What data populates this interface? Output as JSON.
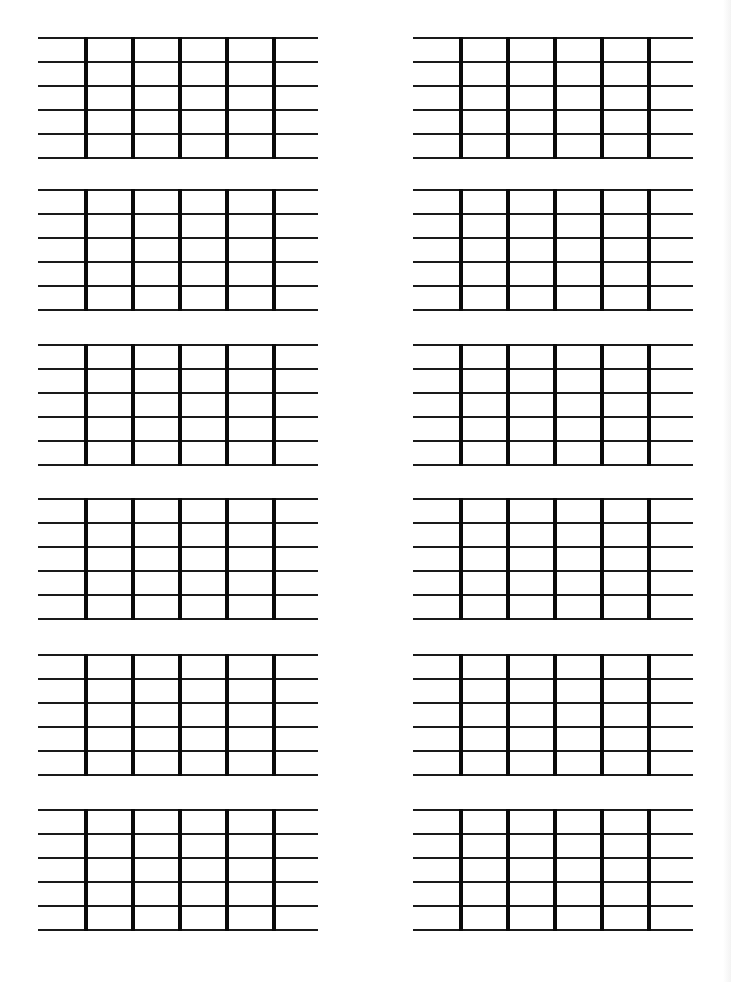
{
  "sheet": {
    "title": "",
    "background": "#ffffff",
    "line_color": "#1a1a1a",
    "fret_color": "#0a0a0a",
    "strings_per_diagram": 6,
    "frets_per_diagram": 5,
    "string_spacing_px": 24,
    "fret_offsets_px": [
      46,
      93,
      140,
      187,
      234
    ],
    "columns_x": [
      38,
      413
    ],
    "rows_y": [
      37,
      189,
      344,
      498,
      654,
      809
    ],
    "diagrams": [
      {
        "id": 1,
        "row": 1,
        "col": 1
      },
      {
        "id": 2,
        "row": 1,
        "col": 2
      },
      {
        "id": 3,
        "row": 2,
        "col": 1
      },
      {
        "id": 4,
        "row": 2,
        "col": 2
      },
      {
        "id": 5,
        "row": 3,
        "col": 1
      },
      {
        "id": 6,
        "row": 3,
        "col": 2
      },
      {
        "id": 7,
        "row": 4,
        "col": 1
      },
      {
        "id": 8,
        "row": 4,
        "col": 2
      },
      {
        "id": 9,
        "row": 5,
        "col": 1
      },
      {
        "id": 10,
        "row": 5,
        "col": 2
      },
      {
        "id": 11,
        "row": 6,
        "col": 1
      },
      {
        "id": 12,
        "row": 6,
        "col": 2
      }
    ]
  }
}
